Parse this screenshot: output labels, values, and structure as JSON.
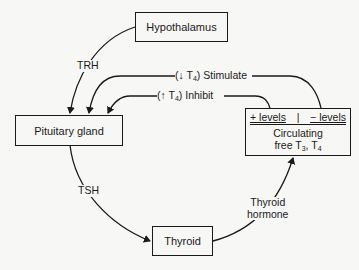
{
  "diagram": {
    "nodes": {
      "hypothalamus": "Hypothalamus",
      "pituitary": "Pituitary gland",
      "thyroid": "Thyroid",
      "circulating": {
        "plus_levels": "+ levels",
        "divider": "|",
        "minus_levels": "− levels",
        "line1": "Circulating",
        "line2_prefix": "free T",
        "line2_sub1": "3",
        "line2_sep": ", T",
        "line2_sub2": "4"
      }
    },
    "edges": {
      "trh": "TRH",
      "tsh": "TSH",
      "thyroid_hormone_1": "Thyroid",
      "thyroid_hormone_2": "hormone",
      "stimulate": {
        "prefix": "(↓ T",
        "sub": "4",
        "suffix": ") Stimulate"
      },
      "inhibit": {
        "prefix": "(↑ T",
        "sub": "4",
        "suffix": ") Inhibit"
      }
    },
    "colors": {
      "ink": "#1a1a1a",
      "paper": "#f7f7f5"
    }
  }
}
